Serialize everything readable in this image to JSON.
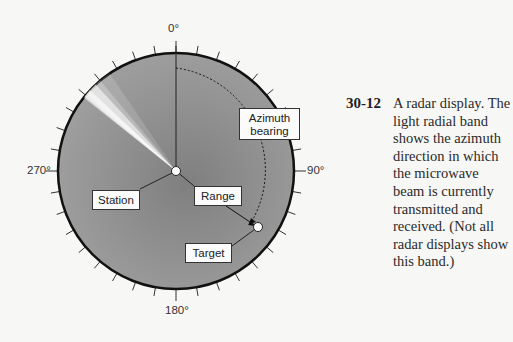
{
  "figure": {
    "type": "radar-display-diagram",
    "degree_labels": {
      "top": "0°",
      "right": "90°",
      "bottom": "180°",
      "left": "270°"
    },
    "callouts": {
      "azimuth": [
        "Azimuth",
        "bearing"
      ],
      "station": "Station",
      "range": "Range",
      "target": "Target"
    },
    "beam_direction_deg": 305,
    "tick_interval_deg": 10,
    "colors": {
      "disc": "#8e8e8e",
      "beam": "#ffffff",
      "rim": "#111111"
    }
  },
  "caption": {
    "number": "30-12",
    "lines": [
      "A radar display. The",
      "light radial band",
      "shows the azimuth",
      "direction in which",
      "the microwave",
      "beam is currently",
      "transmitted and",
      "received. (Not all",
      "radar displays show",
      "this band.)"
    ]
  }
}
